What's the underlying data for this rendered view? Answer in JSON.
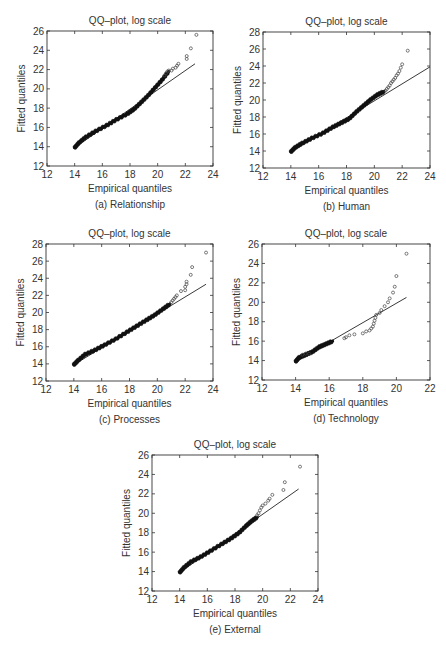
{
  "chart_data": [
    {
      "id": "a",
      "type": "scatter",
      "title": "QQ–plot, log scale",
      "xlabel": "Empirical quantiles",
      "ylabel": "Fitted quantiles",
      "caption": "(a) Relationship",
      "xlim": [
        12,
        24
      ],
      "ylim": [
        12,
        26
      ],
      "xticks": [
        12,
        14,
        16,
        18,
        20,
        22,
        24
      ],
      "yticks": [
        12,
        14,
        16,
        18,
        20,
        22,
        24,
        26
      ],
      "frame": {
        "left": 47,
        "top": 31,
        "right": 213,
        "bottom": 166
      },
      "reference_line": {
        "x": [
          14,
          22.7
        ],
        "y": [
          13.9,
          22.6
        ]
      },
      "body_curve": {
        "x": [
          14,
          14.3,
          14.8,
          15.5,
          16.3,
          17.0,
          17.8,
          18.3,
          18.8,
          19.3,
          19.8,
          20.3,
          20.8
        ],
        "y": [
          13.9,
          14.4,
          15.0,
          15.6,
          16.2,
          16.8,
          17.4,
          17.9,
          18.6,
          19.3,
          20.1,
          20.9,
          21.8
        ]
      },
      "tail_points": {
        "x": [
          20.5,
          20.6,
          20.7,
          20.8,
          21.0,
          21.1,
          21.3,
          21.4,
          21.5,
          22.1,
          22.1,
          22.4,
          22.8
        ],
        "y": [
          21.4,
          21.6,
          21.8,
          21.9,
          21.9,
          22.1,
          22.2,
          22.4,
          22.6,
          23.1,
          23.4,
          24.2,
          25.6
        ]
      }
    },
    {
      "id": "b",
      "type": "scatter",
      "title": "QQ–plot, log scale",
      "xlabel": "Empirical quantiles",
      "ylabel": "Fitted quantiles",
      "caption": "(b) Human",
      "xlim": [
        12,
        24
      ],
      "ylim": [
        12,
        28
      ],
      "xticks": [
        12,
        14,
        16,
        18,
        20,
        22,
        24
      ],
      "yticks": [
        12,
        14,
        16,
        18,
        20,
        22,
        24,
        26,
        28
      ],
      "frame": {
        "left": 263,
        "top": 32,
        "right": 430,
        "bottom": 168
      },
      "reference_line": {
        "x": [
          14,
          24
        ],
        "y": [
          13.9,
          23.9
        ]
      },
      "body_curve": {
        "x": [
          14,
          14.3,
          14.8,
          15.5,
          16.3,
          17.0,
          17.6,
          18.2,
          18.7,
          19.2,
          19.7,
          20.2,
          20.7
        ],
        "y": [
          13.9,
          14.4,
          14.9,
          15.5,
          16.1,
          16.8,
          17.3,
          17.8,
          18.6,
          19.3,
          20.0,
          20.6,
          21.0
        ]
      },
      "tail_points": {
        "x": [
          20.8,
          20.9,
          21.0,
          21.1,
          21.2,
          21.3,
          21.4,
          21.5,
          21.6,
          21.7,
          21.8,
          21.9,
          22.0,
          22.4
        ],
        "y": [
          21.1,
          21.3,
          21.5,
          21.7,
          22.0,
          22.2,
          22.4,
          22.6,
          22.9,
          23.1,
          23.4,
          23.8,
          24.2,
          25.8
        ]
      }
    },
    {
      "id": "c",
      "type": "scatter",
      "title": "QQ–plot, log scale",
      "xlabel": "Empirical quantiles",
      "ylabel": "Fitted quantiles",
      "caption": "(c) Processes",
      "xlim": [
        12,
        24
      ],
      "ylim": [
        12,
        28
      ],
      "xticks": [
        12,
        14,
        16,
        18,
        20,
        22,
        24
      ],
      "yticks": [
        12,
        14,
        16,
        18,
        20,
        22,
        24,
        26,
        28
      ],
      "frame": {
        "left": 46,
        "top": 244,
        "right": 213,
        "bottom": 381
      },
      "reference_line": {
        "x": [
          14,
          23.5
        ],
        "y": [
          13.9,
          23.3
        ]
      },
      "body_curve": {
        "x": [
          14,
          14.3,
          14.8,
          15.5,
          16.2,
          17.0,
          17.8,
          18.5,
          19.2,
          19.8,
          20.4,
          20.9
        ],
        "y": [
          13.9,
          14.4,
          15.1,
          15.6,
          16.2,
          16.9,
          17.7,
          18.4,
          19.1,
          19.7,
          20.4,
          21.0
        ]
      },
      "tail_points": {
        "x": [
          21.0,
          21.1,
          21.2,
          21.3,
          21.4,
          21.7,
          22.0,
          22.0,
          22.1,
          22.1,
          22.4,
          22.5,
          23.5
        ],
        "y": [
          21.2,
          21.4,
          21.6,
          21.8,
          22.0,
          22.5,
          22.6,
          23.0,
          23.3,
          23.6,
          24.4,
          25.3,
          27.0
        ]
      }
    },
    {
      "id": "d",
      "type": "scatter",
      "title": "QQ–plot, log scale",
      "xlabel": "Empirical quantiles",
      "ylabel": "Fitted quantiles",
      "caption": "(d) Technology",
      "xlim": [
        12,
        22
      ],
      "ylim": [
        12,
        26
      ],
      "xticks": [
        12,
        14,
        16,
        18,
        20,
        22
      ],
      "yticks": [
        12,
        14,
        16,
        18,
        20,
        22,
        24,
        26
      ],
      "frame": {
        "left": 262,
        "top": 244,
        "right": 430,
        "bottom": 380
      },
      "reference_line": {
        "x": [
          14,
          20.6
        ],
        "y": [
          13.9,
          20.5
        ]
      },
      "body_curve": {
        "x": [
          14,
          14.2,
          14.6,
          15.0,
          15.4,
          15.8,
          16.2
        ],
        "y": [
          13.9,
          14.3,
          14.6,
          14.9,
          15.4,
          15.7,
          16.0
        ]
      },
      "tail_points": {
        "x": [
          14.4,
          14.6,
          14.8,
          16.9,
          17.0,
          17.2,
          17.5,
          18.0,
          18.2,
          18.4,
          18.5,
          18.6,
          18.65,
          18.7,
          18.75,
          18.8,
          19.0,
          19.1,
          19.3,
          19.5,
          19.6,
          19.8,
          19.9,
          20.0,
          20.6
        ],
        "y": [
          14.6,
          14.7,
          14.7,
          16.3,
          16.4,
          16.6,
          16.7,
          16.8,
          17.0,
          17.1,
          17.3,
          17.5,
          17.8,
          18.1,
          18.4,
          18.7,
          18.9,
          19.2,
          19.6,
          20.0,
          20.4,
          21.0,
          21.6,
          22.7,
          25.0
        ]
      }
    },
    {
      "id": "e",
      "type": "scatter",
      "title": "QQ–plot, log scale",
      "xlabel": "Empirical quantiles",
      "ylabel": "Fitted quantiles",
      "caption": "(e) External",
      "xlim": [
        12,
        24
      ],
      "ylim": [
        12,
        26
      ],
      "xticks": [
        12,
        14,
        16,
        18,
        20,
        22,
        24
      ],
      "yticks": [
        12,
        14,
        16,
        18,
        20,
        22,
        24,
        26
      ],
      "frame": {
        "left": 152,
        "top": 455,
        "right": 318,
        "bottom": 591
      },
      "reference_line": {
        "x": [
          14,
          22.6
        ],
        "y": [
          13.9,
          22.5
        ]
      },
      "body_curve": {
        "x": [
          14,
          14.3,
          14.8,
          15.5,
          16.2,
          17.0,
          17.7,
          18.3,
          18.8,
          19.2,
          19.6
        ],
        "y": [
          13.9,
          14.4,
          15.0,
          15.5,
          16.1,
          16.8,
          17.4,
          18.0,
          18.7,
          19.2,
          19.6
        ]
      },
      "tail_points": {
        "x": [
          19.6,
          19.7,
          19.8,
          19.9,
          20.0,
          20.2,
          20.4,
          20.5,
          20.7,
          21.5,
          21.6,
          22.7
        ],
        "y": [
          19.8,
          20.0,
          20.3,
          20.6,
          20.8,
          21.0,
          21.3,
          21.5,
          21.9,
          22.4,
          23.2,
          24.8
        ]
      }
    }
  ]
}
